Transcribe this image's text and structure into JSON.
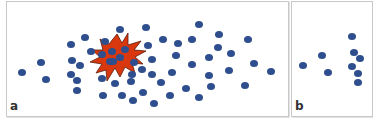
{
  "figure": {
    "colors": {
      "dot": "#2e4e8e",
      "burst_fill": "#d9380f",
      "burst_stroke": "#5a1a08",
      "border": "#c8c8c8"
    },
    "panels": [
      {
        "label": "a",
        "burst": {
          "cx": 116,
          "cy": 56,
          "description": "red explosion star highlighting a cluster of dots"
        },
        "dots": [
          [
            22,
            72
          ],
          [
            41,
            62
          ],
          [
            46,
            79
          ],
          [
            71,
            44
          ],
          [
            85,
            37
          ],
          [
            72,
            60
          ],
          [
            80,
            65
          ],
          [
            71,
            74
          ],
          [
            77,
            80
          ],
          [
            77,
            90
          ],
          [
            91,
            51
          ],
          [
            120,
            29
          ],
          [
            146,
            27
          ],
          [
            105,
            41
          ],
          [
            102,
            54
          ],
          [
            112,
            51
          ],
          [
            110,
            61
          ],
          [
            125,
            49
          ],
          [
            113,
            61
          ],
          [
            120,
            57
          ],
          [
            134,
            62
          ],
          [
            148,
            45
          ],
          [
            102,
            78
          ],
          [
            115,
            83
          ],
          [
            132,
            74
          ],
          [
            131,
            81
          ],
          [
            142,
            69
          ],
          [
            103,
            95
          ],
          [
            122,
            95
          ],
          [
            133,
            100
          ],
          [
            143,
            92
          ],
          [
            154,
            103
          ],
          [
            199,
            24
          ],
          [
            163,
            39
          ],
          [
            178,
            43
          ],
          [
            192,
            39
          ],
          [
            219,
            34
          ],
          [
            218,
            47
          ],
          [
            152,
            59
          ],
          [
            176,
            55
          ],
          [
            209,
            57
          ],
          [
            192,
            64
          ],
          [
            152,
            74
          ],
          [
            172,
            72
          ],
          [
            209,
            75
          ],
          [
            161,
            82
          ],
          [
            211,
            86
          ],
          [
            186,
            88
          ],
          [
            170,
            95
          ],
          [
            199,
            97
          ],
          [
            248,
            39
          ],
          [
            231,
            53
          ],
          [
            254,
            63
          ],
          [
            229,
            70
          ],
          [
            271,
            71
          ],
          [
            245,
            85
          ]
        ]
      },
      {
        "label": "b",
        "dots": [
          [
            303,
            65
          ],
          [
            322,
            55
          ],
          [
            328,
            72
          ],
          [
            352,
            36
          ],
          [
            354,
            52
          ],
          [
            360,
            58
          ],
          [
            352,
            66
          ],
          [
            358,
            73
          ],
          [
            358,
            82
          ]
        ]
      }
    ]
  }
}
